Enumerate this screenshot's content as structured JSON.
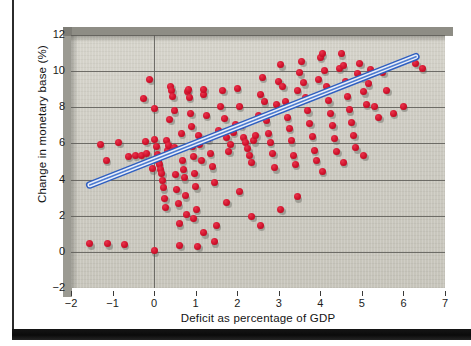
{
  "figure": {
    "cut_off_caption": "",
    "background_color": "#ffffff",
    "plot_background_color": "#cfcdc4",
    "accent_color": "#d0112b",
    "trendline_color": "#2f5fc0"
  },
  "chart_data": {
    "type": "scatter",
    "title": "",
    "xlabel": "Deficit as percentage of GDP",
    "ylabel": "Change in monetary base (%)",
    "xlim": [
      -2,
      7
    ],
    "ylim": [
      -2,
      12
    ],
    "xticks": [
      -2,
      -1,
      0,
      1,
      2,
      3,
      4,
      5,
      6,
      7
    ],
    "xtick_labels": [
      "−2",
      "−1",
      "0",
      "1",
      "2",
      "3",
      "4",
      "5",
      "6",
      "7"
    ],
    "yticks": [
      -2,
      0,
      2,
      4,
      6,
      8,
      10,
      12
    ],
    "ytick_labels": [
      "−2",
      "0",
      "2",
      "4",
      "6",
      "8",
      "10",
      "12"
    ],
    "grid": "horizontal gridlines at every y tick; vertical line at x = 0",
    "legend": "none",
    "marker": {
      "shape": "circle",
      "color": "#d0112b",
      "size": 7,
      "shadow": true
    },
    "trendline": {
      "style": "thick blue band with light fill",
      "x_start": -1.55,
      "y_start": 3.7,
      "x_end": 6.3,
      "y_end": 10.8,
      "slope": 0.904,
      "intercept": 5.1
    },
    "points": [
      [
        -1.55,
        0.45
      ],
      [
        -1.12,
        0.45
      ],
      [
        -0.72,
        0.42
      ],
      [
        -1.3,
        5.95
      ],
      [
        -1.15,
        5.05
      ],
      [
        -0.85,
        6.05
      ],
      [
        -0.62,
        5.3
      ],
      [
        -0.45,
        5.35
      ],
      [
        -0.3,
        5.35
      ],
      [
        -0.25,
        8.5
      ],
      [
        -0.2,
        6.1
      ],
      [
        -0.18,
        5.45
      ],
      [
        -0.1,
        9.55
      ],
      [
        -0.05,
        4.6
      ],
      [
        0.0,
        0.05
      ],
      [
        0.0,
        7.95
      ],
      [
        0.02,
        6.2
      ],
      [
        0.05,
        5.85
      ],
      [
        0.08,
        5.4
      ],
      [
        0.1,
        5.0
      ],
      [
        0.12,
        4.85
      ],
      [
        0.15,
        4.55
      ],
      [
        0.18,
        4.35
      ],
      [
        0.2,
        3.95
      ],
      [
        0.22,
        3.55
      ],
      [
        0.25,
        2.95
      ],
      [
        0.28,
        2.45
      ],
      [
        0.3,
        6.15
      ],
      [
        0.32,
        5.6
      ],
      [
        0.35,
        5.9
      ],
      [
        0.38,
        7.35
      ],
      [
        0.4,
        9.15
      ],
      [
        0.42,
        8.95
      ],
      [
        0.45,
        8.6
      ],
      [
        0.48,
        7.8
      ],
      [
        0.5,
        5.75
      ],
      [
        0.52,
        4.3
      ],
      [
        0.55,
        3.45
      ],
      [
        0.58,
        2.65
      ],
      [
        0.6,
        1.55
      ],
      [
        0.62,
        0.35
      ],
      [
        0.65,
        6.55
      ],
      [
        0.68,
        5.05
      ],
      [
        0.7,
        4.55
      ],
      [
        0.72,
        4.1
      ],
      [
        0.75,
        3.1
      ],
      [
        0.78,
        2.05
      ],
      [
        0.8,
        8.9
      ],
      [
        0.82,
        9.0
      ],
      [
        0.85,
        8.55
      ],
      [
        0.88,
        7.65
      ],
      [
        0.9,
        6.95
      ],
      [
        0.92,
        5.85
      ],
      [
        0.95,
        5.3
      ],
      [
        0.98,
        4.35
      ],
      [
        1.0,
        3.6
      ],
      [
        1.02,
        2.35
      ],
      [
        1.05,
        0.3
      ],
      [
        1.08,
        6.45
      ],
      [
        1.1,
        5.95
      ],
      [
        1.15,
        5.05
      ],
      [
        1.18,
        8.7
      ],
      [
        1.2,
        9.0
      ],
      [
        1.25,
        7.55
      ],
      [
        1.3,
        6.25
      ],
      [
        1.35,
        5.45
      ],
      [
        1.4,
        4.7
      ],
      [
        1.45,
        3.85
      ],
      [
        1.5,
        1.45
      ],
      [
        1.55,
        6.7
      ],
      [
        1.6,
        8.05
      ],
      [
        1.65,
        8.95
      ],
      [
        1.7,
        7.4
      ],
      [
        1.75,
        6.35
      ],
      [
        1.8,
        5.55
      ],
      [
        1.85,
        5.95
      ],
      [
        1.9,
        6.6
      ],
      [
        1.95,
        7.05
      ],
      [
        2.0,
        9.05
      ],
      [
        2.05,
        8.05
      ],
      [
        2.1,
        7.0
      ],
      [
        2.15,
        6.35
      ],
      [
        2.2,
        6.05
      ],
      [
        2.25,
        5.7
      ],
      [
        2.3,
        5.35
      ],
      [
        2.35,
        4.95
      ],
      [
        2.4,
        6.15
      ],
      [
        2.45,
        6.45
      ],
      [
        2.5,
        7.55
      ],
      [
        2.55,
        8.7
      ],
      [
        2.6,
        9.65
      ],
      [
        2.65,
        8.3
      ],
      [
        2.7,
        7.25
      ],
      [
        2.75,
        6.55
      ],
      [
        2.8,
        6.05
      ],
      [
        2.85,
        5.45
      ],
      [
        2.9,
        4.65
      ],
      [
        2.95,
        8.15
      ],
      [
        3.0,
        9.45
      ],
      [
        3.05,
        10.35
      ],
      [
        3.1,
        9.15
      ],
      [
        3.15,
        8.3
      ],
      [
        3.2,
        7.45
      ],
      [
        3.25,
        6.85
      ],
      [
        3.3,
        6.15
      ],
      [
        3.35,
        5.35
      ],
      [
        3.4,
        4.85
      ],
      [
        3.45,
        8.95
      ],
      [
        3.5,
        9.9
      ],
      [
        3.55,
        10.55
      ],
      [
        3.6,
        9.35
      ],
      [
        3.65,
        8.55
      ],
      [
        3.7,
        7.8
      ],
      [
        3.75,
        7.1
      ],
      [
        3.8,
        6.4
      ],
      [
        3.85,
        5.6
      ],
      [
        3.9,
        5.05
      ],
      [
        3.95,
        9.55
      ],
      [
        4.0,
        10.75
      ],
      [
        4.05,
        10.95
      ],
      [
        4.1,
        10.05
      ],
      [
        4.15,
        9.15
      ],
      [
        4.2,
        8.35
      ],
      [
        4.25,
        7.65
      ],
      [
        4.3,
        7.0
      ],
      [
        4.35,
        6.25
      ],
      [
        4.4,
        5.55
      ],
      [
        4.45,
        10.15
      ],
      [
        4.5,
        10.95
      ],
      [
        4.55,
        10.3
      ],
      [
        4.6,
        9.45
      ],
      [
        4.65,
        8.6
      ],
      [
        4.7,
        7.85
      ],
      [
        4.75,
        7.15
      ],
      [
        4.8,
        6.45
      ],
      [
        4.85,
        5.75
      ],
      [
        4.9,
        9.85
      ],
      [
        4.95,
        10.45
      ],
      [
        5.0,
        9.65
      ],
      [
        5.05,
        8.85
      ],
      [
        5.1,
        8.15
      ],
      [
        5.15,
        9.3
      ],
      [
        5.2,
        10.1
      ],
      [
        5.3,
        8.05
      ],
      [
        5.4,
        7.45
      ],
      [
        5.5,
        9.95
      ],
      [
        5.6,
        8.95
      ],
      [
        5.75,
        7.65
      ],
      [
        6.0,
        8.05
      ],
      [
        6.3,
        10.45
      ],
      [
        6.45,
        10.15
      ],
      [
        2.35,
        1.95
      ],
      [
        2.55,
        1.45
      ],
      [
        1.2,
        1.05
      ],
      [
        1.45,
        0.55
      ],
      [
        3.05,
        2.35
      ],
      [
        3.45,
        3.05
      ],
      [
        2.05,
        3.35
      ],
      [
        1.75,
        2.75
      ],
      [
        4.05,
        4.45
      ],
      [
        4.55,
        4.95
      ],
      [
        5.05,
        5.35
      ],
      [
        0.95,
        1.85
      ]
    ]
  }
}
